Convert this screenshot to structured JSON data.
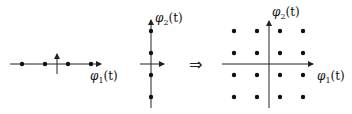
{
  "figure": {
    "panel1": {
      "title": "1D constellation along phi1",
      "axis_label": {
        "base": "φ",
        "sub": "1",
        "arg": "(t)"
      },
      "points_x": [
        22,
        45,
        68,
        91
      ]
    },
    "panel2": {
      "title": "1D constellation along phi2",
      "axis_label": {
        "base": "φ",
        "sub": "2",
        "arg": "(t)"
      },
      "points_y": [
        31,
        53,
        75,
        97
      ]
    },
    "implies": "⇒",
    "panel3": {
      "title": "2D 16-point grid constellation",
      "axis_label_x": {
        "base": "φ",
        "sub": "1",
        "arg": "(t)"
      },
      "axis_label_y": {
        "base": "φ",
        "sub": "2",
        "arg": "(t)"
      },
      "grid_x": [
        234,
        257,
        280,
        303
      ],
      "grid_y": [
        31,
        53,
        75,
        97
      ]
    }
  }
}
